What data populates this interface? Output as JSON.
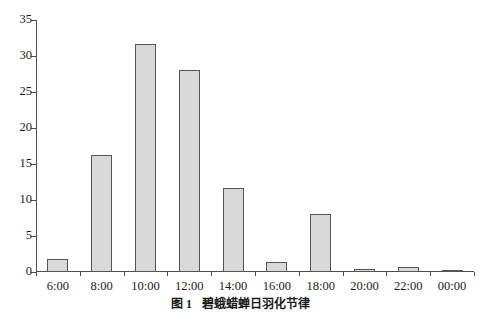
{
  "caption": {
    "label": "图 1",
    "title": "碧蛾蜡蝉日羽化节律"
  },
  "chart_data": {
    "type": "bar",
    "title": "",
    "subtitle": "",
    "xlabel": "",
    "ylabel": "",
    "categories": [
      "6:00",
      "8:00",
      "10:00",
      "12:00",
      "14:00",
      "16:00",
      "18:00",
      "20:00",
      "22:00",
      "00:00"
    ],
    "values": [
      1.8,
      16.3,
      31.6,
      28.0,
      11.6,
      1.4,
      8.0,
      0.4,
      0.7,
      0.3
    ],
    "series": [
      {
        "name": "羽化率",
        "values": [
          1.8,
          16.3,
          31.6,
          28.0,
          11.6,
          1.4,
          8.0,
          0.4,
          0.7,
          0.3
        ]
      }
    ],
    "ylim": [
      0,
      35
    ],
    "yticks": [
      0,
      5,
      10,
      15,
      20,
      25,
      30,
      35
    ],
    "ytick_labels": [
      "0",
      "5",
      "10",
      "15",
      "20",
      "25",
      "30",
      "35"
    ],
    "xtick_labels": [
      "6:00",
      "8:00",
      "10:00",
      "12:00",
      "14:00",
      "16:00",
      "18:00",
      "20:00",
      "00:00",
      "22:00"
    ],
    "grid": false,
    "legend": "none",
    "bar_fill_color": "#d9d9d9",
    "bar_edge_color": "#555555",
    "axis_color": "#4d4d4d"
  }
}
